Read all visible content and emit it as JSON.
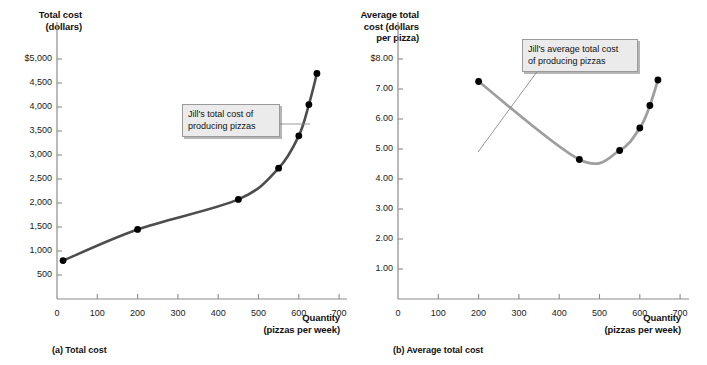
{
  "figure": {
    "panels": [
      {
        "id": "a",
        "caption": "(a) Total cost",
        "y_axis_title": "Total cost\n(dollars)",
        "x_axis_title": "Quantity\n(pizzas per week)",
        "callout": "Jill's total cost of\nproducing pizzas",
        "y_ticks": [
          "$5,000",
          "4,500",
          "4,000",
          "3,500",
          "3,000",
          "2,500",
          "2,000",
          "1,500",
          "1,000",
          "500"
        ],
        "x_ticks": [
          "0",
          "100",
          "200",
          "300",
          "400",
          "500",
          "600",
          "700"
        ],
        "curve_color": "#4d4d4d",
        "point_color": "#000000"
      },
      {
        "id": "b",
        "caption": "(b) Average total cost",
        "y_axis_title": "Average total\ncost (dollars\nper pizza)",
        "x_axis_title": "Quantity\n(pizzas per week)",
        "callout": "Jill's average total cost\nof producing pizzas",
        "y_ticks": [
          "$8.00",
          "7.00",
          "6.00",
          "5.00",
          "4.00",
          "3.00",
          "2.00",
          "1.00"
        ],
        "x_ticks": [
          "0",
          "100",
          "200",
          "300",
          "400",
          "500",
          "600",
          "700"
        ],
        "curve_color": "#9e9e9e",
        "point_color": "#000000"
      }
    ]
  },
  "chart_data": [
    {
      "type": "line",
      "panel": "a",
      "title": "(a) Total cost",
      "xlabel": "Quantity (pizzas per week)",
      "ylabel": "Total cost (dollars)",
      "xlim": [
        0,
        700
      ],
      "ylim": [
        0,
        5250
      ],
      "xticks": [
        0,
        100,
        200,
        300,
        400,
        500,
        600,
        700
      ],
      "yticks": [
        500,
        1000,
        1500,
        2000,
        2500,
        3000,
        3500,
        4000,
        4500,
        5000
      ],
      "ytick_labels": [
        "500",
        "1,000",
        "1,500",
        "2,000",
        "2,500",
        "3,000",
        "3,500",
        "4,000",
        "4,500",
        "$5,000"
      ],
      "grid": false,
      "legend": "none",
      "annotations": [
        "Jill's total cost of producing pizzas"
      ],
      "markers": true,
      "x": [
        15,
        200,
        450,
        550,
        600,
        625,
        645
      ],
      "y": [
        800,
        1450,
        2075,
        2725,
        3400,
        4050,
        4700
      ],
      "series": [
        {
          "name": "Jill's total cost of producing pizzas",
          "points": [
            {
              "x": 15,
              "y": 800
            },
            {
              "x": 200,
              "y": 1450
            },
            {
              "x": 450,
              "y": 2075
            },
            {
              "x": 550,
              "y": 2725
            },
            {
              "x": 600,
              "y": 3400
            },
            {
              "x": 625,
              "y": 4050
            },
            {
              "x": 645,
              "y": 4700
            }
          ]
        }
      ]
    },
    {
      "type": "line",
      "panel": "b",
      "title": "(b) Average total cost",
      "xlabel": "Quantity (pizzas per week)",
      "ylabel": "Average total cost (dollars per pizza)",
      "xlim": [
        0,
        700
      ],
      "ylim": [
        0,
        8.3
      ],
      "xticks": [
        0,
        100,
        200,
        300,
        400,
        500,
        600,
        700
      ],
      "yticks": [
        1,
        2,
        3,
        4,
        5,
        6,
        7,
        8
      ],
      "ytick_labels": [
        "1.00",
        "2.00",
        "3.00",
        "4.00",
        "5.00",
        "6.00",
        "7.00",
        "$8.00"
      ],
      "grid": false,
      "legend": "none",
      "annotations": [
        "Jill's average total cost of producing pizzas"
      ],
      "markers": true,
      "x": [
        200,
        450,
        550,
        600,
        625,
        645
      ],
      "y": [
        7.25,
        4.65,
        4.95,
        5.7,
        6.45,
        7.3
      ],
      "series": [
        {
          "name": "Jill's average total cost of producing pizzas",
          "points": [
            {
              "x": 200,
              "y": 7.25
            },
            {
              "x": 450,
              "y": 4.65
            },
            {
              "x": 550,
              "y": 4.95
            },
            {
              "x": 600,
              "y": 5.7
            },
            {
              "x": 625,
              "y": 6.45
            },
            {
              "x": 645,
              "y": 7.3
            }
          ]
        }
      ]
    }
  ]
}
